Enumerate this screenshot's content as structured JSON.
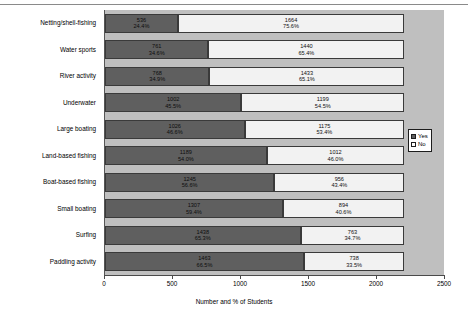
{
  "chart_data": {
    "type": "bar",
    "subtype": "horizontal-stacked",
    "title": "",
    "xlabel": "Number and % of Students",
    "ylabel": "",
    "xlim": [
      0,
      2500
    ],
    "xticks": [
      0,
      500,
      1000,
      1500,
      2000,
      2500
    ],
    "xtick_labels": [
      "0",
      "500",
      "1000",
      "1500",
      "2000",
      "2500"
    ],
    "grid": false,
    "legend_position": "right",
    "categories": [
      "Netting/shell-fishing",
      "Water sports",
      "River activity",
      "Underwater",
      "Large boating",
      "Land-based fishing",
      "Boat-based fishing",
      "Small boating",
      "Surfing",
      "Paddling activity"
    ],
    "series": [
      {
        "name": "Yes",
        "color": "#5f5f5f",
        "values": [
          536,
          761,
          768,
          1002,
          1026,
          1189,
          1245,
          1307,
          1438,
          1463
        ],
        "percent_labels": [
          "24.4%",
          "34.6%",
          "34.9%",
          "45.5%",
          "46.6%",
          "54.0%",
          "56.6%",
          "59.4%",
          "65.3%",
          "66.5%"
        ]
      },
      {
        "name": "No",
        "color": "#f2f2f2",
        "values": [
          1664,
          1440,
          1433,
          1199,
          1175,
          1012,
          956,
          894,
          763,
          738
        ],
        "percent_labels": [
          "75.6%",
          "65.4%",
          "65.1%",
          "54.5%",
          "53.4%",
          "46.0%",
          "43.4%",
          "40.6%",
          "34.7%",
          "33.5%"
        ]
      }
    ]
  },
  "legend": {
    "items": [
      {
        "label": "Yes",
        "color": "#5f5f5f"
      },
      {
        "label": "No",
        "color": "#ffffff"
      }
    ]
  },
  "axis": {
    "x_title": "Number and % of Students"
  }
}
